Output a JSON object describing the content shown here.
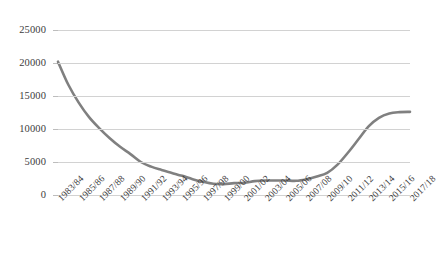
{
  "chart_data": {
    "type": "line",
    "title": "",
    "subtitle": "",
    "xlabel": "",
    "ylabel": "",
    "ylim": [
      0,
      25000
    ],
    "ytick_labels": [
      "25000",
      "20000",
      "15000",
      "10000",
      "5000",
      "0"
    ],
    "ytick_values": [
      25000,
      20000,
      15000,
      10000,
      5000,
      0
    ],
    "grid": true,
    "legend": false,
    "legend_position": "none",
    "line_color": "#808080",
    "gridline_color": "#d2d2d2",
    "text_color": "#3c3c3c",
    "xtick_labels": [
      "1983/84",
      "1985/86",
      "1987/88",
      "1989/90",
      "1991/92",
      "1993/94",
      "1995/96",
      "1997/98",
      "1999/00",
      "2001/02",
      "2003/04",
      "2005/06",
      "2007/08",
      "2009/10",
      "2011/12",
      "2013/14",
      "2015/16",
      "2017/18"
    ],
    "categories": [
      "1983/84",
      "1984/85",
      "1985/86",
      "1986/87",
      "1987/88",
      "1988/89",
      "1989/90",
      "1990/91",
      "1991/92",
      "1992/93",
      "1993/94",
      "1994/95",
      "1995/96",
      "1996/97",
      "1997/98",
      "1998/99",
      "1999/00",
      "2000/01",
      "2001/02",
      "2002/03",
      "2003/04",
      "2004/05",
      "2005/06",
      "2006/07",
      "2007/08",
      "2008/09",
      "2009/10",
      "2010/11",
      "2011/12",
      "2012/13",
      "2013/14",
      "2014/15",
      "2015/16",
      "2016/17",
      "2017/18"
    ],
    "values": [
      20200,
      16700,
      14000,
      11800,
      10100,
      8600,
      7300,
      6200,
      5000,
      4300,
      3800,
      3350,
      2900,
      2400,
      2000,
      1700,
      1650,
      1800,
      1850,
      2100,
      2200,
      2200,
      2200,
      2150,
      2400,
      2800,
      3350,
      4600,
      6400,
      8400,
      10400,
      11700,
      12350,
      12550,
      12600
    ]
  }
}
